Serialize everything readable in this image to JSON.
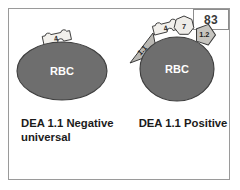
{
  "figure": {
    "page_number": "83",
    "border_color": "#9a9a9a",
    "background_color": "#ffffff"
  },
  "colors": {
    "cell_fill": "#6e6e6e",
    "cell_stroke": "#3d3d3d",
    "cell_label_color": "#ffffff",
    "marker_light_fill": "#f2f0ec",
    "marker_mid_fill": "#d6d4cf",
    "marker_dark_fill": "#9a9893",
    "marker_stroke": "#3a3a3a",
    "text_color": "#1b1b1b"
  },
  "panels": [
    {
      "id": "left",
      "cell_label": "RBC",
      "caption": "DEA 1.1 Negative\nuniversal",
      "markers": [
        {
          "label": "4",
          "shape": "jigsaw",
          "position": "top"
        }
      ]
    },
    {
      "id": "right",
      "cell_label": "RBC",
      "caption": "DEA 1.1 Positive",
      "markers": [
        {
          "label": "1.1",
          "shape": "triangle",
          "position": "upper-left"
        },
        {
          "label": "4",
          "shape": "jigsaw",
          "position": "top-left"
        },
        {
          "label": "7",
          "shape": "heptagon",
          "position": "top"
        },
        {
          "label": "1.2",
          "shape": "pentagon",
          "position": "upper-right"
        }
      ]
    }
  ]
}
